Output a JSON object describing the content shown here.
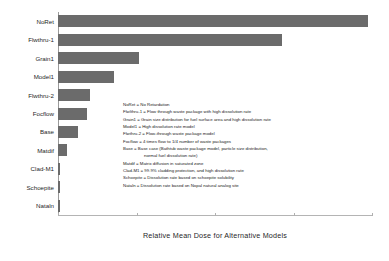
{
  "chart_data": {
    "type": "bar",
    "title": "",
    "orientation": "horizontal",
    "xlabel": "Relative  Mean Dose for Alternative Models",
    "ylabel": "",
    "grid": false,
    "legend_position": "inside-right",
    "xlim": [
      0,
      1.0
    ],
    "categories": [
      "NoRet",
      "Flwthru-1",
      "Grain1",
      "Model1",
      "Flwthru-2",
      "Focflow",
      "Base",
      "Matdif",
      "Clad-M1",
      "Schoepite",
      "Nataln"
    ],
    "values": [
      0.988,
      0.712,
      0.258,
      0.178,
      0.102,
      0.093,
      0.065,
      0.03,
      0.006,
      0.006,
      0.006
    ],
    "bar_color": "#6b6b6b",
    "tick_positions": [
      0,
      0.25,
      0.5,
      0.75,
      1.0
    ]
  },
  "axis": {
    "x_title": "Relative  Mean Dose for Alternative Models"
  },
  "legend": {
    "lines": [
      {
        "text": "NoRet = No Retardation",
        "continuation": false
      },
      {
        "text": "Flwlthru-1 = Flow through waste package with high dissolution rate",
        "continuation": false
      },
      {
        "text": "Grain1 = Grain size distribution for fuel surface area and high dissolution rate",
        "continuation": false
      },
      {
        "text": "Model1 = High dissolution rate model",
        "continuation": false
      },
      {
        "text": "Flwthru-2 = Flow-through waste package model",
        "continuation": false
      },
      {
        "text": "Focflow = 4 times flow to 1/4 number of waste packages",
        "continuation": false
      },
      {
        "text": "Base = Base case (Bathtub waste package model, particle size distribution,",
        "continuation": false
      },
      {
        "text": "normal fuel dissolution rate)",
        "continuation": true
      },
      {
        "text": "Matdif = Matrix diffusion in saturated zone",
        "continuation": false
      },
      {
        "text": "Clad-M1 = 99.9% cladding protection, and high dissolution rate",
        "continuation": false
      },
      {
        "text": "Schoepite = Dissolution rate based on schoepite solubility",
        "continuation": false
      },
      {
        "text": "Nataln = Dissolution rate based on Nopal natural analog site",
        "continuation": false
      }
    ]
  },
  "colors": {
    "bar": "#6b6b6b",
    "axis": "#9a9a9a",
    "text": "#1f1f1f",
    "background": "#ffffff"
  }
}
